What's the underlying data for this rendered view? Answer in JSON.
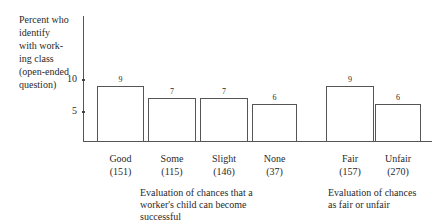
{
  "chart_data": {
    "type": "bar",
    "title": "",
    "ylabel": "Percent who identify with working class (open-ended question)",
    "ylabel_lines": [
      "Percent who",
      "identify",
      "with work-",
      "ing class",
      "(open-ended",
      "question)"
    ],
    "xlabel": "",
    "yticks": [
      5,
      10
    ],
    "ylim": [
      0,
      20
    ],
    "grid": false,
    "categories": [
      "Good (151)",
      "Some (115)",
      "Slight (146)",
      "None (37)",
      "Fair (157)",
      "Unfair (270)"
    ],
    "values": [
      9,
      7,
      7,
      6,
      9,
      6
    ],
    "bars": [
      {
        "label": "Good",
        "n": "(151)",
        "value": 9,
        "value_label": "9",
        "group": 0
      },
      {
        "label": "Some",
        "n": "(115)",
        "value": 7,
        "value_label": "7",
        "group": 0
      },
      {
        "label": "Slight",
        "n": "(146)",
        "value": 7,
        "value_label": "7",
        "group": 0
      },
      {
        "label": "None",
        "n": "(37)",
        "value": 6,
        "value_label": "6",
        "group": 0
      },
      {
        "label": "Fair",
        "n": "(157)",
        "value": 9,
        "value_label": "9",
        "group": 1
      },
      {
        "label": "Unfair",
        "n": "(270)",
        "value": 6,
        "value_label": "6",
        "group": 1
      }
    ],
    "groups": [
      {
        "lines": [
          "Evaluation of chances that a",
          "worker's child can become",
          "successful"
        ]
      },
      {
        "lines": [
          "Evaluation of chances",
          "as fair or unfair"
        ]
      }
    ]
  }
}
